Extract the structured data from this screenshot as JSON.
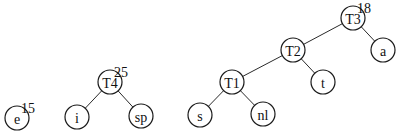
{
  "diagram": {
    "type": "huffman-forest",
    "nodes": [
      {
        "id": "e",
        "label": "e",
        "x": 17,
        "y": 118,
        "weight": "15"
      },
      {
        "id": "T4",
        "label": "T4",
        "x": 110,
        "y": 82,
        "weight": "25"
      },
      {
        "id": "i",
        "label": "i",
        "x": 77,
        "y": 117
      },
      {
        "id": "sp",
        "label": "sp",
        "x": 141,
        "y": 116
      },
      {
        "id": "T3",
        "label": "T3",
        "x": 353,
        "y": 18,
        "weight": "18"
      },
      {
        "id": "T2",
        "label": "T2",
        "x": 293,
        "y": 50
      },
      {
        "id": "a",
        "label": "a",
        "x": 383,
        "y": 50
      },
      {
        "id": "T1",
        "label": "T1",
        "x": 232,
        "y": 82
      },
      {
        "id": "t",
        "label": "t",
        "x": 323,
        "y": 82
      },
      {
        "id": "s",
        "label": "s",
        "x": 200,
        "y": 115
      },
      {
        "id": "nl",
        "label": "nl",
        "x": 263,
        "y": 114
      }
    ],
    "edges": [
      [
        "T4",
        "i"
      ],
      [
        "T4",
        "sp"
      ],
      [
        "T3",
        "T2"
      ],
      [
        "T3",
        "a"
      ],
      [
        "T2",
        "T1"
      ],
      [
        "T2",
        "t"
      ],
      [
        "T1",
        "s"
      ],
      [
        "T1",
        "nl"
      ]
    ],
    "radius": 12
  }
}
